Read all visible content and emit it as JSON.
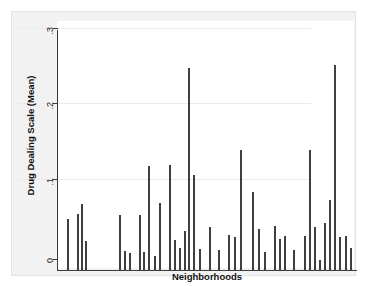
{
  "figure": {
    "background_color": "#f2f2f2",
    "plot_background_color": "#ffffff",
    "bar_color": "#3f3f3f",
    "grid_color": "#ebebeb",
    "axis_color": "#3a3a3a",
    "top_artifact_text": "·        ·        ·       ·        ·"
  },
  "chart_data": {
    "type": "bar",
    "title": "",
    "subtitle": "",
    "xlabel": "Neighborhoods",
    "ylabel": "Drug Dealing Scale (Mean)",
    "ylim": [
      0,
      0.31
    ],
    "ytick_labels": [
      "0",
      ".1",
      ".2",
      ".3"
    ],
    "ytick_values": [
      0,
      0.1,
      0.2,
      0.3
    ],
    "xtick_labels": [],
    "grid": "horizontal",
    "legend": "none",
    "annotations": [],
    "categories": [
      "N1",
      "N2",
      "N3",
      "N4",
      "N5",
      "N6",
      "N7",
      "N8",
      "N9",
      "N10",
      "N11",
      "N12",
      "N13",
      "N14",
      "N15",
      "N16",
      "N17",
      "N18",
      "N19",
      "N20",
      "N21",
      "N22",
      "N23",
      "N24",
      "N25",
      "N26",
      "N27",
      "N28",
      "N29",
      "N30",
      "N31",
      "N32",
      "N33",
      "N34",
      "N35",
      "N36",
      "N37",
      "N38",
      "N39",
      "N40",
      "N41"
    ],
    "values": [
      0.068,
      0.075,
      0.092,
      0.039,
      0.073,
      0.027,
      0.025,
      0.073,
      0.022,
      0.136,
      0.018,
      0.084,
      0.052,
      0.03,
      0.136,
      0.083,
      0.248,
      0.12,
      0.029,
      0.058,
      0.028,
      0.047,
      0.045,
      0.157,
      0.103,
      0.055,
      0.025,
      0.059,
      0.042,
      0.046,
      0.028,
      0.046,
      0.157,
      0.057,
      0.014,
      0.063,
      0.092,
      0.268,
      0.045,
      0.046,
      0.03
    ],
    "bar_pixel_positions": [
      {
        "x": 55,
        "h": 52
      },
      {
        "x": 65,
        "h": 57
      },
      {
        "x": 69,
        "h": 67
      },
      {
        "x": 73,
        "h": 30
      },
      {
        "x": 107,
        "h": 56
      },
      {
        "x": 112,
        "h": 20
      },
      {
        "x": 117,
        "h": 18
      },
      {
        "x": 127,
        "h": 56
      },
      {
        "x": 131,
        "h": 19
      },
      {
        "x": 136,
        "h": 105
      },
      {
        "x": 142,
        "h": 15
      },
      {
        "x": 147,
        "h": 68
      },
      {
        "x": 157,
        "h": 106
      },
      {
        "x": 162,
        "h": 31
      },
      {
        "x": 167,
        "h": 23
      },
      {
        "x": 172,
        "h": 40
      },
      {
        "x": 176,
        "h": 203
      },
      {
        "x": 181,
        "h": 96
      },
      {
        "x": 187,
        "h": 22
      },
      {
        "x": 197,
        "h": 44
      },
      {
        "x": 206,
        "h": 21
      },
      {
        "x": 216,
        "h": 36
      },
      {
        "x": 222,
        "h": 34
      },
      {
        "x": 228,
        "h": 121
      },
      {
        "x": 240,
        "h": 79
      },
      {
        "x": 246,
        "h": 42
      },
      {
        "x": 252,
        "h": 19
      },
      {
        "x": 262,
        "h": 45
      },
      {
        "x": 267,
        "h": 32
      },
      {
        "x": 272,
        "h": 35
      },
      {
        "x": 281,
        "h": 21
      },
      {
        "x": 292,
        "h": 35
      },
      {
        "x": 297,
        "h": 121
      },
      {
        "x": 302,
        "h": 44
      },
      {
        "x": 307,
        "h": 11
      },
      {
        "x": 312,
        "h": 48
      },
      {
        "x": 317,
        "h": 71
      },
      {
        "x": 322,
        "h": 206
      },
      {
        "x": 327,
        "h": 34
      },
      {
        "x": 333,
        "h": 35
      },
      {
        "x": 338,
        "h": 23
      }
    ]
  }
}
